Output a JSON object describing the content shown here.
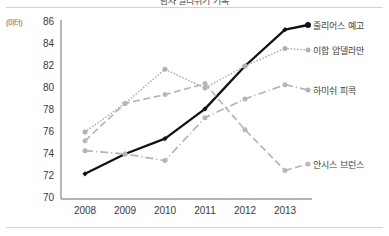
{
  "chart_data": {
    "type": "line",
    "title": "남자 멀리뛰기 기록",
    "unit_label": "(미터)",
    "xlabel": "",
    "ylabel": "",
    "categories": [
      "2008",
      "2009",
      "2010",
      "2011",
      "2012",
      "2013"
    ],
    "x": [
      2008,
      2009,
      2010,
      2011,
      2012,
      2013
    ],
    "ylim": [
      70,
      86
    ],
    "ytick_values": [
      86,
      84,
      82,
      80,
      78,
      76,
      74,
      72,
      70
    ],
    "ytick_labels": [
      "86",
      "84",
      "82",
      "80",
      "78",
      "76",
      "74",
      "72",
      "70"
    ],
    "grid": false,
    "legend_position": "right",
    "series": [
      {
        "name": "줄리어스 예고",
        "color": "#111111",
        "style": "solid",
        "marker": "diamond",
        "values": [
          72.2,
          74.0,
          75.4,
          78.1,
          82.0,
          85.3
        ]
      },
      {
        "name": "이합 압델라만",
        "color": "#b0b0b0",
        "style": "dotted",
        "marker": "circle",
        "values": [
          76.0,
          78.6,
          81.7,
          80.0,
          82.0,
          83.6
        ]
      },
      {
        "name": "하미쉬 피콕",
        "color": "#b5b5b5",
        "style": "dashdot",
        "marker": "circle",
        "values": [
          74.3,
          74.0,
          73.4,
          77.3,
          79.0,
          80.3
        ]
      },
      {
        "name": "안시스 브런스",
        "color": "#b8b8b8",
        "style": "dashed",
        "marker": "circle",
        "values": [
          75.2,
          78.6,
          79.4,
          80.4,
          76.2,
          72.5
        ]
      }
    ]
  },
  "axis": {
    "y": {
      "t0": "86",
      "t1": "84",
      "t2": "82",
      "t3": "80",
      "t4": "78",
      "t5": "76",
      "t6": "74",
      "t7": "72",
      "t8": "70"
    },
    "x": {
      "t0": "2008",
      "t1": "2009",
      "t2": "2010",
      "t3": "2011",
      "t4": "2012",
      "t5": "2013"
    }
  },
  "legend": {
    "s0": "줄리어스 예고",
    "s1": "이합 압델라만",
    "s2": "하미쉬 피콕",
    "s3": "안시스 브런스"
  }
}
